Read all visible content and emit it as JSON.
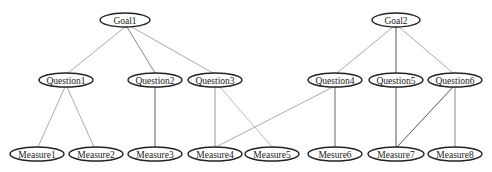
{
  "diagram": {
    "type": "GQM hierarchy tree",
    "nodes": [
      {
        "id": "goal1",
        "label": "Goal1",
        "level": "goal",
        "cx": 125,
        "cy": 20,
        "rx": 25,
        "ry": 7
      },
      {
        "id": "goal2",
        "label": "Goal2",
        "level": "goal",
        "cx": 396,
        "cy": 20,
        "rx": 24,
        "ry": 7
      },
      {
        "id": "question1",
        "label": "Question1",
        "level": "question",
        "cx": 66,
        "cy": 80,
        "rx": 27,
        "ry": 7
      },
      {
        "id": "question2",
        "label": "Question2",
        "level": "question",
        "cx": 155,
        "cy": 80,
        "rx": 27,
        "ry": 7
      },
      {
        "id": "question3",
        "label": "Question3",
        "level": "question",
        "cx": 215,
        "cy": 80,
        "rx": 27,
        "ry": 7
      },
      {
        "id": "question4",
        "label": "Question4",
        "level": "question",
        "cx": 335,
        "cy": 80,
        "rx": 27,
        "ry": 7
      },
      {
        "id": "question5",
        "label": "Question5",
        "level": "question",
        "cx": 396,
        "cy": 80,
        "rx": 27,
        "ry": 7
      },
      {
        "id": "question6",
        "label": "Question6",
        "level": "question",
        "cx": 455,
        "cy": 80,
        "rx": 27,
        "ry": 7
      },
      {
        "id": "measure1",
        "label": "Measure1",
        "level": "measure",
        "cx": 37,
        "cy": 154,
        "rx": 27,
        "ry": 7
      },
      {
        "id": "measure2",
        "label": "Measure2",
        "level": "measure",
        "cx": 96,
        "cy": 154,
        "rx": 27,
        "ry": 7
      },
      {
        "id": "measure3",
        "label": "Measure3",
        "level": "measure",
        "cx": 155,
        "cy": 154,
        "rx": 27,
        "ry": 7
      },
      {
        "id": "measure4",
        "label": "Measure4",
        "level": "measure",
        "cx": 215,
        "cy": 154,
        "rx": 27,
        "ry": 7
      },
      {
        "id": "measure5",
        "label": "Measure5",
        "level": "measure",
        "cx": 272,
        "cy": 154,
        "rx": 27,
        "ry": 7
      },
      {
        "id": "measure6",
        "label": "Mesure6",
        "level": "measure",
        "cx": 335,
        "cy": 154,
        "rx": 27,
        "ry": 7
      },
      {
        "id": "measure7",
        "label": "Measure7",
        "level": "measure",
        "cx": 396,
        "cy": 154,
        "rx": 28,
        "ry": 7
      },
      {
        "id": "measure8",
        "label": "Measure8",
        "level": "measure",
        "cx": 455,
        "cy": 154,
        "rx": 27,
        "ry": 7
      }
    ],
    "edges": [
      {
        "from": "goal1",
        "to": "question1",
        "x1": 125,
        "y1": 27,
        "x2": 68,
        "y2": 73,
        "color": "#aaaaaa"
      },
      {
        "from": "goal1",
        "to": "question2",
        "x1": 127,
        "y1": 27,
        "x2": 155,
        "y2": 73,
        "color": "#888888"
      },
      {
        "from": "goal1",
        "to": "question3",
        "x1": 130,
        "y1": 26,
        "x2": 213,
        "y2": 73,
        "color": "#aaaaaa"
      },
      {
        "from": "goal2",
        "to": "question4",
        "x1": 393,
        "y1": 27,
        "x2": 337,
        "y2": 73,
        "color": "#aaaaaa"
      },
      {
        "from": "goal2",
        "to": "question5",
        "x1": 396,
        "y1": 27,
        "x2": 396,
        "y2": 73,
        "color": "#555555"
      },
      {
        "from": "goal2",
        "to": "question6",
        "x1": 399,
        "y1": 27,
        "x2": 453,
        "y2": 73,
        "color": "#aaaaaa"
      },
      {
        "from": "question1",
        "to": "measure1",
        "x1": 65,
        "y1": 87,
        "x2": 38,
        "y2": 147,
        "color": "#aaaaaa"
      },
      {
        "from": "question1",
        "to": "measure2",
        "x1": 67,
        "y1": 87,
        "x2": 94,
        "y2": 147,
        "color": "#aaaaaa"
      },
      {
        "from": "question2",
        "to": "measure3",
        "x1": 155,
        "y1": 87,
        "x2": 155,
        "y2": 147,
        "color": "#666666"
      },
      {
        "from": "question3",
        "to": "measure4",
        "x1": 215,
        "y1": 87,
        "x2": 215,
        "y2": 147,
        "color": "#999999"
      },
      {
        "from": "question3",
        "to": "measure5",
        "x1": 220,
        "y1": 87,
        "x2": 272,
        "y2": 147,
        "color": "#bbbbbb"
      },
      {
        "from": "question4",
        "to": "measure4",
        "x1": 333,
        "y1": 87,
        "x2": 216,
        "y2": 147,
        "color": "#aaaaaa"
      },
      {
        "from": "question4",
        "to": "measure6",
        "x1": 335,
        "y1": 87,
        "x2": 335,
        "y2": 147,
        "color": "#666666"
      },
      {
        "from": "question5",
        "to": "measure7",
        "x1": 396,
        "y1": 87,
        "x2": 396,
        "y2": 147,
        "color": "#555555"
      },
      {
        "from": "question6",
        "to": "measure7",
        "x1": 453,
        "y1": 87,
        "x2": 397,
        "y2": 147,
        "color": "#555555"
      },
      {
        "from": "question6",
        "to": "measure8",
        "x1": 455,
        "y1": 87,
        "x2": 455,
        "y2": 147,
        "color": "#888888"
      }
    ]
  }
}
